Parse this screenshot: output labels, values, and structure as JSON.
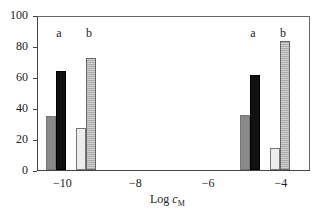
{
  "chart_data": {
    "type": "bar",
    "title": "",
    "xlabel": "Log c_M",
    "xlabel_main": "Log ",
    "xlabel_var": "c",
    "xlabel_sub": "M",
    "ylabel": "",
    "ylim": [
      0,
      100
    ],
    "yticks": [
      "0",
      "20",
      "40",
      "60",
      "80",
      "100"
    ],
    "xticks": [
      "−10",
      "−8",
      "−6",
      "−4"
    ],
    "xtick_values": [
      -10,
      -8,
      -6,
      -4
    ],
    "xlim": [
      -10.7,
      -3.2
    ],
    "grid": false,
    "legend": null,
    "groups": [
      {
        "position": "−10",
        "labels": [
          "a",
          "b"
        ],
        "bars": [
          {
            "series": "a-gray",
            "value": 35
          },
          {
            "series": "a-black",
            "value": 64
          },
          {
            "series": "b-light",
            "value": 27
          },
          {
            "series": "b-striped",
            "value": 73
          }
        ]
      },
      {
        "position": "−4",
        "labels": [
          "a",
          "b"
        ],
        "bars": [
          {
            "series": "a-gray",
            "value": 36
          },
          {
            "series": "a-black",
            "value": 62
          },
          {
            "series": "b-light",
            "value": 14
          },
          {
            "series": "b-striped",
            "value": 84
          }
        ]
      }
    ],
    "series": [
      {
        "name": "a (gray)",
        "values": [
          35,
          36
        ]
      },
      {
        "name": "a (black)",
        "values": [
          64,
          62
        ]
      },
      {
        "name": "b (light)",
        "values": [
          27,
          14
        ]
      },
      {
        "name": "b (striped)",
        "values": [
          73,
          84
        ]
      }
    ],
    "categories": [
      "−10",
      "−4"
    ],
    "annotations": [
      "a",
      "b",
      "a",
      "b"
    ]
  }
}
